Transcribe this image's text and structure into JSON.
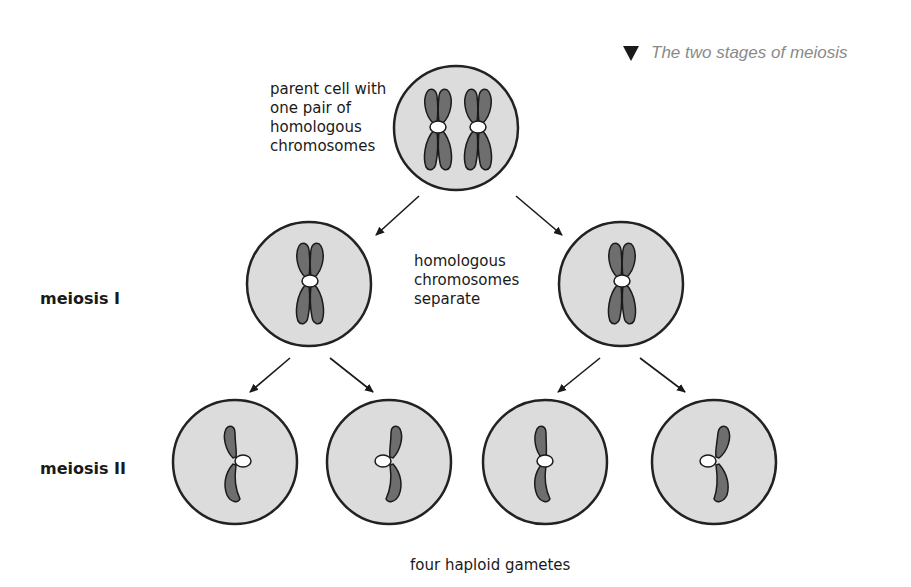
{
  "caption": {
    "marker": "triangle-down",
    "text": "The two stages of meiosis"
  },
  "labels": {
    "parent": "parent cell with\none pair of\nhomologous\nchromosomes",
    "separate": "homologous\nchromosomes\nseparate",
    "gametes": "four haploid gametes"
  },
  "stages": {
    "meiosis1": "meiosis I",
    "meiosis2": "meiosis II"
  },
  "colors": {
    "cell_fill": "#dcdcdc",
    "cell_stroke": "#222222",
    "chromosome": "#6e6e6e",
    "centromere": "#ffffff"
  },
  "cells": [
    {
      "id": "parent",
      "cx": 456,
      "cy": 128,
      "r": 62,
      "chromosomes": 2
    },
    {
      "id": "m1-left",
      "cx": 309,
      "cy": 284,
      "r": 62,
      "chromosomes": 1
    },
    {
      "id": "m1-right",
      "cx": 621,
      "cy": 284,
      "r": 62,
      "chromosomes": 1
    },
    {
      "id": "m2-1",
      "cx": 235,
      "cy": 462,
      "r": 62,
      "chromosomes": 0.5
    },
    {
      "id": "m2-2",
      "cx": 389,
      "cy": 462,
      "r": 62,
      "chromosomes": 0.5
    },
    {
      "id": "m2-3",
      "cx": 545,
      "cy": 462,
      "r": 62,
      "chromosomes": 0.5
    },
    {
      "id": "m2-4",
      "cx": 714,
      "cy": 462,
      "r": 62,
      "chromosomes": 0.5
    }
  ]
}
